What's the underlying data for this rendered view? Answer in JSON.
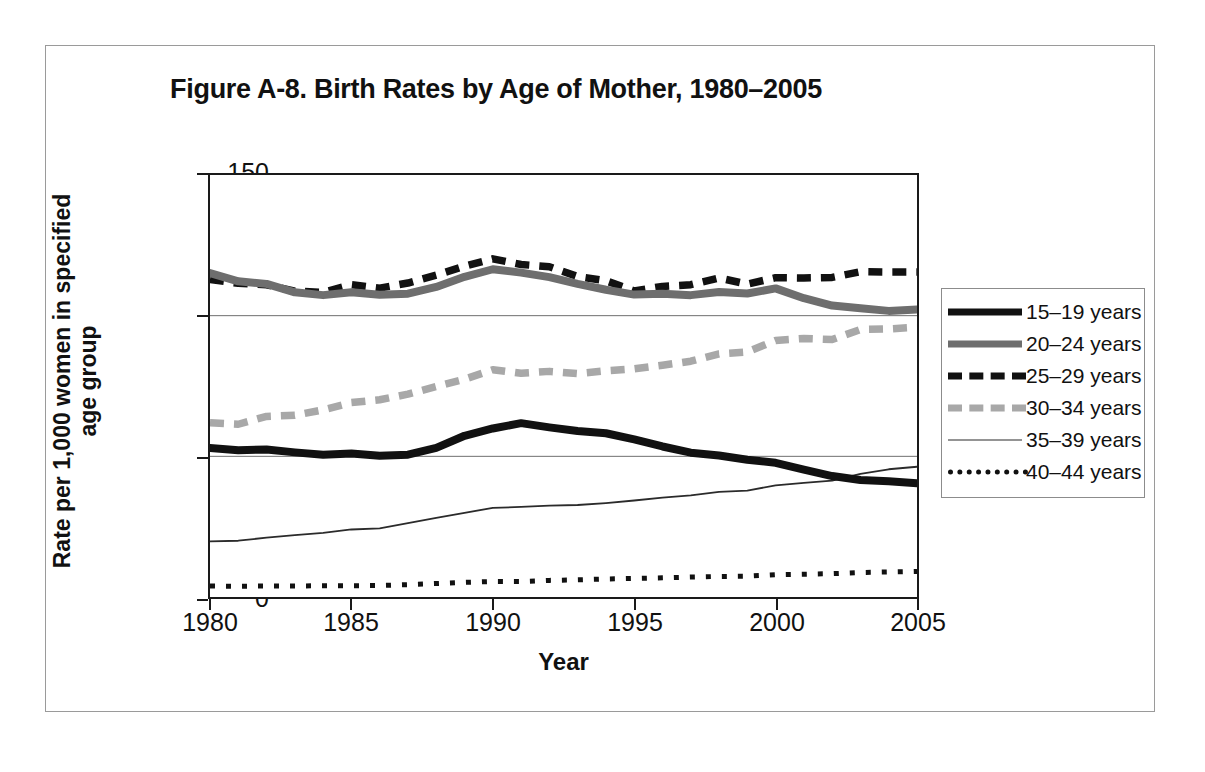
{
  "figure": {
    "title": "Figure A-8. Birth Rates by Age of Mother, 1980–2005",
    "x_axis_title": "Year",
    "y_axis_title_line1": "Rate per 1,000 women in specified",
    "y_axis_title_line2": "age group"
  },
  "axes": {
    "y_ticks": [
      "0",
      "50",
      "100",
      "150"
    ],
    "x_ticks": [
      "1980",
      "1985",
      "1990",
      "1995",
      "2000",
      "2005"
    ]
  },
  "legend": {
    "items": [
      {
        "label": "15–19 years",
        "style": "sw-solid-thick",
        "color": "#111111"
      },
      {
        "label": "20–24 years",
        "style": "sw-solid-thick-gray",
        "color": "#6e6e6e"
      },
      {
        "label": "25–29 years",
        "style": "sw-dash-black",
        "color": "#111111"
      },
      {
        "label": "30–34 years",
        "style": "sw-dash-gray",
        "color": "#a8a8a8"
      },
      {
        "label": "35–39 years",
        "style": "sw-thin",
        "color": "#2b2b2b"
      },
      {
        "label": "40–44 years",
        "style": "sw-dot-black",
        "color": "#111111"
      }
    ]
  },
  "chart_data": {
    "type": "line",
    "title": "Figure A-8. Birth Rates by Age of Mother, 1980–2005",
    "xlabel": "Year",
    "ylabel": "Rate per 1,000 women in specified age group",
    "xlim": [
      1980,
      2005
    ],
    "ylim": [
      0,
      150
    ],
    "yticks": [
      0,
      50,
      100,
      150
    ],
    "xticks": [
      1980,
      1985,
      1990,
      1995,
      2000,
      2005
    ],
    "grid": "horizontal",
    "legend_position": "right",
    "x": [
      1980,
      1981,
      1982,
      1983,
      1984,
      1985,
      1986,
      1987,
      1988,
      1989,
      1990,
      1991,
      1992,
      1993,
      1994,
      1995,
      1996,
      1997,
      1998,
      1999,
      2000,
      2001,
      2002,
      2003,
      2004,
      2005
    ],
    "series": [
      {
        "name": "15–19 years",
        "style": "solid-thick-black",
        "color": "#111111",
        "values": [
          53.0,
          52.2,
          52.4,
          51.4,
          50.6,
          51.0,
          50.2,
          50.6,
          53.0,
          57.3,
          59.9,
          61.8,
          60.3,
          59.0,
          58.2,
          56.0,
          53.5,
          51.3,
          50.3,
          48.8,
          47.7,
          45.3,
          43.0,
          41.6,
          41.1,
          40.4
        ]
      },
      {
        "name": "20–24 years",
        "style": "solid-thick-gray",
        "color": "#6e6e6e",
        "values": [
          115.1,
          112.2,
          111.3,
          108.3,
          107.3,
          108.3,
          107.4,
          107.8,
          110.2,
          113.8,
          116.5,
          115.3,
          113.7,
          111.3,
          109.2,
          107.5,
          107.8,
          107.3,
          108.4,
          107.9,
          109.7,
          106.2,
          103.6,
          102.6,
          101.7,
          102.2
        ]
      },
      {
        "name": "25–29 years",
        "style": "dashed-black",
        "color": "#111111",
        "values": [
          112.9,
          111.5,
          111.0,
          108.7,
          108.3,
          111.0,
          109.8,
          111.6,
          114.4,
          117.6,
          120.2,
          118.2,
          117.4,
          113.9,
          112.4,
          108.8,
          110.4,
          111.0,
          113.4,
          111.2,
          113.5,
          113.4,
          113.6,
          115.6,
          115.5,
          115.5
        ]
      },
      {
        "name": "30–34 years",
        "style": "dashed-gray",
        "color": "#a8a8a8",
        "values": [
          61.9,
          61.4,
          64.2,
          64.6,
          66.5,
          69.1,
          70.1,
          72.1,
          74.8,
          77.4,
          80.8,
          79.5,
          80.2,
          79.4,
          80.4,
          81.1,
          82.4,
          83.8,
          86.4,
          87.1,
          91.2,
          91.9,
          91.5,
          95.1,
          95.3,
          95.9
        ]
      },
      {
        "name": "35–39 years",
        "style": "thin-solid",
        "color": "#2b2b2b",
        "values": [
          19.8,
          20.0,
          21.1,
          22.0,
          22.8,
          24.0,
          24.4,
          26.3,
          28.1,
          29.9,
          31.7,
          32.0,
          32.5,
          32.7,
          33.4,
          34.3,
          35.3,
          36.1,
          37.4,
          37.8,
          39.7,
          40.6,
          41.4,
          43.8,
          45.4,
          46.3
        ]
      },
      {
        "name": "40–44 years",
        "style": "dotted-black",
        "color": "#111111",
        "values": [
          3.9,
          3.8,
          3.9,
          3.9,
          4.0,
          4.0,
          4.1,
          4.4,
          4.8,
          5.2,
          5.5,
          5.5,
          5.9,
          6.1,
          6.4,
          6.6,
          6.8,
          7.1,
          7.3,
          7.4,
          7.9,
          8.1,
          8.3,
          8.7,
          8.9,
          9.1
        ]
      }
    ]
  }
}
